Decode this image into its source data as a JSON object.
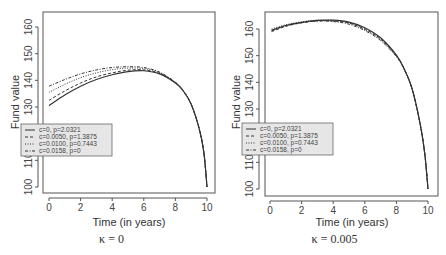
{
  "chart_data": [
    {
      "type": "line",
      "title": "",
      "caption": "κ = 0",
      "xlabel": "Time (in years)",
      "ylabel": "Fund value",
      "xlim": [
        0,
        10
      ],
      "ylim": [
        100,
        165
      ],
      "xticks": [
        0,
        2,
        4,
        6,
        8,
        10
      ],
      "yticks": [
        100,
        110,
        120,
        130,
        140,
        150,
        160
      ],
      "grid": false,
      "legend_position": "left-middle",
      "x": [
        0,
        1,
        2,
        3,
        4,
        5,
        6,
        7,
        8,
        8.5,
        9,
        9.5,
        9.8,
        10
      ],
      "series": [
        {
          "name": "c=0, p=2.0321",
          "style": "solid",
          "values": [
            130.5,
            134.5,
            137.8,
            140.3,
            142.1,
            143.3,
            143.6,
            142.4,
            139.0,
            136.0,
            131.0,
            122.0,
            113.0,
            100.0
          ]
        },
        {
          "name": "c=0.0050, p=1.3875",
          "style": "dashed",
          "values": [
            132.5,
            136.0,
            139.0,
            141.3,
            142.8,
            143.8,
            143.9,
            142.6,
            139.1,
            136.0,
            131.0,
            122.0,
            113.0,
            100.0
          ]
        },
        {
          "name": "c=0.0100, p=0.7443",
          "style": "dotted",
          "values": [
            135.5,
            138.5,
            141.0,
            142.8,
            144.0,
            144.6,
            144.4,
            142.9,
            139.2,
            136.1,
            131.0,
            122.0,
            113.0,
            100.0
          ]
        },
        {
          "name": "c=0.0158, p=0",
          "style": "dotdash",
          "values": [
            137.8,
            140.3,
            142.4,
            143.9,
            144.8,
            145.1,
            144.8,
            143.1,
            139.3,
            136.1,
            131.0,
            122.0,
            113.0,
            100.0
          ]
        }
      ]
    },
    {
      "type": "line",
      "title": "",
      "caption": "κ = 0.005",
      "xlabel": "Time (in years)",
      "ylabel": "Fund value",
      "xlim": [
        0,
        10
      ],
      "ylim": [
        100,
        165
      ],
      "xticks": [
        0,
        2,
        4,
        6,
        8,
        10
      ],
      "yticks": [
        100,
        110,
        120,
        130,
        140,
        150,
        160
      ],
      "grid": false,
      "legend_position": "left-middle",
      "x": [
        0.1,
        1,
        2,
        3,
        4,
        5,
        6,
        7,
        8,
        8.5,
        9,
        9.5,
        9.8,
        10
      ],
      "series": [
        {
          "name": "c=0, p=2.0321",
          "style": "solid",
          "values": [
            159.5,
            161.3,
            162.5,
            163.2,
            163.3,
            162.6,
            160.5,
            156.7,
            150.2,
            145.0,
            137.5,
            124.5,
            113.0,
            100.0
          ]
        },
        {
          "name": "c=0.0050, p=1.3875",
          "style": "dashed",
          "values": [
            159.0,
            161.0,
            162.3,
            163.0,
            163.0,
            162.2,
            160.0,
            156.3,
            150.0,
            144.9,
            137.4,
            124.5,
            113.0,
            100.0
          ]
        },
        {
          "name": "c=0.0100, p=0.7443",
          "style": "dotted",
          "values": [
            160.0,
            161.6,
            162.7,
            163.3,
            163.2,
            162.3,
            159.8,
            156.0,
            149.8,
            144.8,
            137.4,
            124.5,
            113.0,
            100.0
          ]
        },
        {
          "name": "c=0.0158, p=0",
          "style": "dotdash",
          "values": [
            159.3,
            161.2,
            162.4,
            163.0,
            162.8,
            161.8,
            159.4,
            155.7,
            149.6,
            144.7,
            137.3,
            124.5,
            113.0,
            100.0
          ]
        }
      ]
    }
  ],
  "panels": [
    {
      "caption": "κ = 0",
      "xlabel": "Time (in years)",
      "ylabel": "Fund value",
      "xtick_labels": [
        "0",
        "2",
        "4",
        "6",
        "8",
        "10"
      ],
      "ytick_labels": [
        "100",
        "110",
        "120",
        "130",
        "140",
        "150",
        "160"
      ],
      "legend": [
        "c=0, p=2.0321",
        "c=0.0050, p=1.3875",
        "c=0.0100, p=0.7443",
        "c=0.0158, p=0"
      ]
    },
    {
      "caption": "κ = 0.005",
      "xlabel": "Time (in years)",
      "ylabel": "Fund value",
      "xtick_labels": [
        "0",
        "2",
        "4",
        "6",
        "8",
        "10"
      ],
      "ytick_labels": [
        "100",
        "110",
        "120",
        "130",
        "140",
        "150",
        "160"
      ],
      "legend": [
        "c=0, p=2.0321",
        "c=0.0050, p=1.3875",
        "c=0.0100, p=0.7443",
        "c=0.0158, p=0"
      ]
    }
  ],
  "colors": {
    "line": "#333333",
    "frame": "#555555",
    "legend_bg": "#e6e6e6"
  }
}
